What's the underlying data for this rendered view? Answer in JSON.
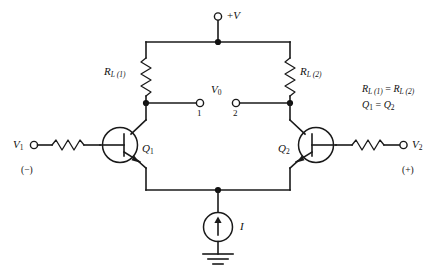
{
  "diagram": {
    "background_color": "#ffffff",
    "line_color": "#1a1a1a"
  },
  "supply": {
    "label_v": "V",
    "label_sign": "+",
    "terminal_name": "positive-supply-terminal"
  },
  "load_resistors": {
    "left": {
      "symbol": "R",
      "subscript": "L (1)",
      "full_label": "R L (1)"
    },
    "right": {
      "symbol": "R",
      "subscript": "L (2)",
      "full_label": "R L (2)"
    }
  },
  "transistors": {
    "left": {
      "symbol": "Q",
      "subscript": "1",
      "type": "npn"
    },
    "right": {
      "symbol": "Q",
      "subscript": "2",
      "type": "npn"
    }
  },
  "output": {
    "label_symbol": "V",
    "label_subscript": "0",
    "terminal_1": "1",
    "terminal_2": "2"
  },
  "inputs": {
    "left": {
      "symbol": "V",
      "subscript": "1",
      "polarity": "(−)"
    },
    "right": {
      "symbol": "V",
      "subscript": "2",
      "polarity": "(+)"
    }
  },
  "current_source": {
    "label": "I",
    "direction": "up",
    "ground": "earth-ground"
  },
  "annotations": {
    "line1_left_symbol": "R",
    "line1_left_sub": "L (1)",
    "line1_eq": "=",
    "line1_right_symbol": "R",
    "line1_right_sub": "L (2)",
    "line2_left_symbol": "Q",
    "line2_left_sub": "1",
    "line2_eq": "=",
    "line2_right_symbol": "Q",
    "line2_right_sub": "2"
  }
}
